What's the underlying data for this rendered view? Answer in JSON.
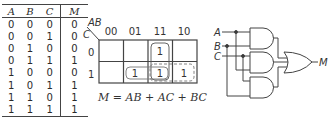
{
  "truth_table": {
    "headers": [
      "A",
      "B",
      "C",
      "M"
    ],
    "rows": [
      [
        "0",
        "0",
        "0",
        "0"
      ],
      [
        "0",
        "0",
        "1",
        "0"
      ],
      [
        "0",
        "1",
        "0",
        "0"
      ],
      [
        "0",
        "1",
        "1",
        "1"
      ],
      [
        "1",
        "0",
        "0",
        "0"
      ],
      [
        "1",
        "0",
        "1",
        "1"
      ],
      [
        "1",
        "1",
        "0",
        "1"
      ],
      [
        "1",
        "1",
        "1",
        "1"
      ]
    ]
  },
  "kmap": {
    "col_var": "AB",
    "row_var": "C",
    "col_labels": [
      "00",
      "01",
      "11",
      "10"
    ],
    "row_labels": [
      "0",
      "1"
    ],
    "cells": [
      [
        "",
        "",
        "1",
        ""
      ],
      [
        "",
        "1",
        "1",
        "1"
      ]
    ],
    "groups": [
      {
        "name": "AB",
        "style": "solid",
        "cells": "col 11, rows 0-1"
      },
      {
        "name": "BC",
        "style": "solid",
        "cells": "row 1, cols 01-11"
      },
      {
        "name": "AC",
        "style": "dashed",
        "cells": "row 1, cols 11-10"
      }
    ]
  },
  "equation": "M = AB + AC + BC",
  "circuit": {
    "inputs": [
      "A",
      "B",
      "C"
    ],
    "output": "M",
    "gates": [
      "AND",
      "AND",
      "AND",
      "OR"
    ]
  }
}
